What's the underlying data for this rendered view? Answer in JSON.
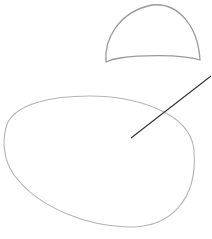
{
  "sketch": {
    "background": "#ffffff",
    "shapes": [
      {
        "name": "dome",
        "stroke": "#9a9a9a",
        "stroke_width": 1.3
      },
      {
        "name": "oval",
        "stroke": "#b4b4b4",
        "stroke_width": 1.1
      },
      {
        "name": "line",
        "stroke": "#333333",
        "stroke_width": 1.1
      }
    ]
  }
}
